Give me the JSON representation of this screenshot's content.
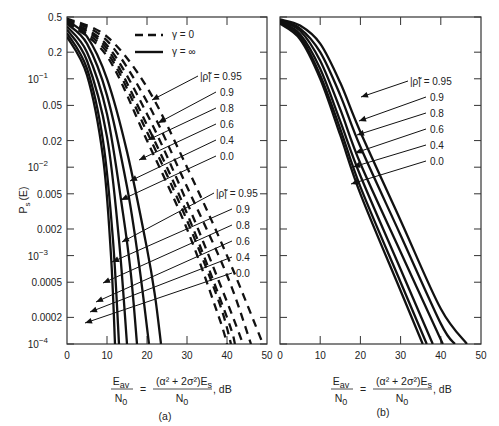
{
  "chart_data": [
    {
      "panel": "(a)",
      "type": "line",
      "title": "",
      "ylabel": "P_s (E)",
      "xlabel": "E_av / N_0 = (α² + 2σ²)E_s / N_0, dB",
      "xlim": [
        0,
        50
      ],
      "ylim": [
        0.0001,
        0.5
      ],
      "yscale": "log",
      "x_ticks": [
        "0",
        "10",
        "20",
        "30",
        "40",
        "50"
      ],
      "y_ticks": [
        "0.5",
        "0.2",
        "10^-1",
        "0.05",
        "0.02",
        "10^-2",
        "0.005",
        "0.002",
        "10^-3",
        "0.0005",
        "0.0002",
        "10^-4"
      ],
      "legend": [
        {
          "style": "dashed",
          "label": "γ = 0"
        },
        {
          "style": "solid",
          "label": "γ = ∞"
        }
      ],
      "series": [
        {
          "name": "γ=∞, |ρ|=0.95",
          "style": "solid",
          "x": [
            0,
            5,
            10,
            15,
            20,
            22,
            23.5
          ],
          "y": [
            0.45,
            0.3,
            0.1,
            0.015,
            0.0012,
            0.00035,
            0.0001
          ]
        },
        {
          "name": "γ=∞, |ρ|=0.9",
          "style": "solid",
          "x": [
            0,
            5,
            10,
            15,
            18,
            20.5
          ],
          "y": [
            0.42,
            0.25,
            0.065,
            0.006,
            0.0008,
            0.0001
          ]
        },
        {
          "name": "γ=∞, |ρ|=0.8",
          "style": "solid",
          "x": [
            0,
            5,
            10,
            14,
            16,
            17.5
          ],
          "y": [
            0.39,
            0.2,
            0.04,
            0.003,
            0.0006,
            0.0001
          ]
        },
        {
          "name": "γ=∞, |ρ|=0.6",
          "style": "solid",
          "x": [
            0,
            5,
            10,
            13,
            15
          ],
          "y": [
            0.36,
            0.16,
            0.022,
            0.0015,
            0.0001
          ]
        },
        {
          "name": "γ=∞, |ρ|=0.4",
          "style": "solid",
          "x": [
            0,
            5,
            9,
            11.5,
            13
          ],
          "y": [
            0.33,
            0.13,
            0.02,
            0.0015,
            0.0001
          ]
        },
        {
          "name": "γ=∞, |ρ|=0.0",
          "style": "solid",
          "x": [
            0,
            5,
            9,
            11,
            12
          ],
          "y": [
            0.3,
            0.11,
            0.013,
            0.001,
            0.0001
          ]
        },
        {
          "name": "γ=0, |ρ|=0.95",
          "style": "dashed",
          "x": [
            0,
            10,
            20,
            30,
            40,
            49
          ],
          "y": [
            0.48,
            0.3,
            0.08,
            0.01,
            0.001,
            0.0001
          ]
        },
        {
          "name": "γ=0, |ρ|=0.9",
          "style": "dashed",
          "x": [
            0,
            10,
            20,
            30,
            40,
            46
          ],
          "y": [
            0.47,
            0.27,
            0.055,
            0.006,
            0.0006,
            0.0001
          ]
        },
        {
          "name": "γ=0, |ρ|=0.8",
          "style": "dashed",
          "x": [
            0,
            10,
            20,
            30,
            40,
            44
          ],
          "y": [
            0.46,
            0.24,
            0.04,
            0.004,
            0.0003,
            0.0001
          ]
        },
        {
          "name": "γ=0, |ρ|=0.6",
          "style": "dashed",
          "x": [
            0,
            10,
            20,
            30,
            40,
            42
          ],
          "y": [
            0.45,
            0.22,
            0.03,
            0.003,
            0.0002,
            0.0001
          ]
        },
        {
          "name": "γ=0, |ρ|=0.4",
          "style": "dashed",
          "x": [
            0,
            10,
            20,
            30,
            38,
            41
          ],
          "y": [
            0.44,
            0.2,
            0.025,
            0.0025,
            0.0003,
            0.0001
          ]
        },
        {
          "name": "γ=0, |ρ|=0.0",
          "style": "dashed",
          "x": [
            0,
            10,
            20,
            30,
            38,
            40
          ],
          "y": [
            0.43,
            0.18,
            0.02,
            0.002,
            0.0002,
            0.0001
          ]
        }
      ],
      "annotations": {
        "upper_group_labels": [
          "|ρ̃| = 0.95",
          "0.9",
          "0.8",
          "0.6",
          "0.4",
          "0.0"
        ],
        "lower_group_labels": [
          "|ρ̃| = 0.95",
          "0.9",
          "0.8",
          "0.6",
          "0.4",
          "0.0"
        ]
      }
    },
    {
      "panel": "(b)",
      "type": "line",
      "title": "",
      "ylabel": "P_s (E)",
      "xlabel": "E_av / N_0 = (α² + 2σ²)E_s / N_0, dB",
      "xlim": [
        0,
        50
      ],
      "ylim": [
        0.0001,
        0.5
      ],
      "yscale": "log",
      "x_ticks": [
        "0",
        "10",
        "20",
        "30",
        "40",
        "50"
      ],
      "series": [
        {
          "name": "|ρ|=0.95",
          "x": [
            0,
            5,
            10,
            15,
            20,
            30,
            40,
            46.5
          ],
          "y": [
            0.47,
            0.4,
            0.25,
            0.09,
            0.025,
            0.0025,
            0.00025,
            0.0001
          ]
        },
        {
          "name": "|ρ|=0.9",
          "x": [
            0,
            5,
            10,
            15,
            20,
            30,
            40,
            43.5
          ],
          "y": [
            0.46,
            0.37,
            0.2,
            0.065,
            0.017,
            0.0017,
            0.00017,
            0.0001
          ]
        },
        {
          "name": "|ρ|=0.8",
          "x": [
            0,
            5,
            10,
            15,
            20,
            30,
            40.5
          ],
          "y": [
            0.45,
            0.35,
            0.16,
            0.045,
            0.011,
            0.0011,
            0.0001
          ]
        },
        {
          "name": "|ρ|=0.6",
          "x": [
            0,
            5,
            10,
            15,
            20,
            30,
            38
          ],
          "y": [
            0.44,
            0.32,
            0.13,
            0.033,
            0.008,
            0.0007,
            0.0001
          ]
        },
        {
          "name": "|ρ|=0.4",
          "x": [
            0,
            5,
            10,
            15,
            20,
            30,
            36.5
          ],
          "y": [
            0.43,
            0.3,
            0.11,
            0.027,
            0.006,
            0.0005,
            0.0001
          ]
        },
        {
          "name": "|ρ|=0.0",
          "x": [
            0,
            5,
            10,
            15,
            20,
            30,
            35.5
          ],
          "y": [
            0.42,
            0.28,
            0.1,
            0.023,
            0.005,
            0.0004,
            0.0001
          ]
        }
      ],
      "annotations": {
        "labels": [
          "|ρ̃| = 0.95",
          "0.9",
          "0.8",
          "0.6",
          "0.4",
          "0.0"
        ]
      }
    }
  ],
  "labels": {
    "ylabel_main": "P",
    "ylabel_sub": "s",
    "ylabel_rest": "(E)",
    "panel_a": "(a)",
    "panel_b": "(b)",
    "legend_dashed": "γ = 0",
    "legend_solid": "γ = ∞",
    "rho_prefix": "|ρ̃| = 0.95",
    "rho_values": [
      "0.9",
      "0.8",
      "0.6",
      "0.4",
      "0.0"
    ],
    "xcap_lhs_num": "E",
    "xcap_lhs_num_sub": "av",
    "xcap_lhs_den": "N",
    "xcap_lhs_den_sub": "0",
    "xcap_eq": "=",
    "xcap_rhs_num": "(α² + 2σ²)E",
    "xcap_rhs_num_sub": "s",
    "xcap_rhs_den": "N",
    "xcap_rhs_den_sub": "0",
    "xcap_unit": ", dB"
  },
  "y_tick_labels": [
    "0.5",
    "0.2",
    "10",
    "0.05",
    "0.02",
    "10",
    "0.005",
    "0.002",
    "10",
    "0.0005",
    "0.0002",
    "10"
  ],
  "y_tick_exps": [
    "",
    "",
    "−1",
    "",
    "",
    "−2",
    "",
    "",
    "−3",
    "",
    "",
    "−4"
  ],
  "x_tick_labels": [
    "0",
    "10",
    "20",
    "30",
    "40",
    "50"
  ]
}
